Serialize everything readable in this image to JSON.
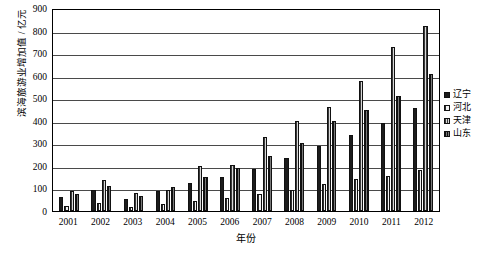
{
  "chart_data": {
    "type": "bar",
    "title": "",
    "xlabel": "年份",
    "ylabel": "滨海旅游业增加值 / 亿元",
    "ylim": [
      0,
      900
    ],
    "yticks": [
      900,
      800,
      700,
      600,
      500,
      400,
      300,
      200,
      100,
      0
    ],
    "grid": true,
    "legend_position": "right",
    "categories": [
      "2001",
      "2002",
      "2003",
      "2004",
      "2005",
      "2006",
      "2007",
      "2008",
      "2009",
      "2010",
      "2011",
      "2012"
    ],
    "series": [
      {
        "name": "辽宁",
        "values": [
          62,
          95,
          55,
          88,
          122,
          150,
          185,
          235,
          290,
          335,
          390,
          455
        ]
      },
      {
        "name": "河北",
        "values": [
          22,
          35,
          20,
          30,
          45,
          58,
          75,
          95,
          118,
          140,
          155,
          180
        ]
      },
      {
        "name": "天津",
        "values": [
          88,
          138,
          82,
          95,
          200,
          205,
          330,
          398,
          462,
          578,
          728,
          822
        ]
      },
      {
        "name": "山东",
        "values": [
          75,
          110,
          68,
          108,
          150,
          190,
          245,
          300,
          398,
          450,
          512,
          608
        ]
      }
    ]
  },
  "legend": {
    "items": [
      {
        "label": "辽宁"
      },
      {
        "label": "河北"
      },
      {
        "label": "天津"
      },
      {
        "label": "山东"
      }
    ]
  },
  "caption": {
    "text": ""
  },
  "colors": {
    "axis": "#000000",
    "grid": "#4a4a4a",
    "series_liaoning": "#1c1c1c",
    "series_hebei": "#2b2b2b",
    "series_tianjin": "#3a3a3a",
    "series_shandong": "#0f0f0f"
  }
}
